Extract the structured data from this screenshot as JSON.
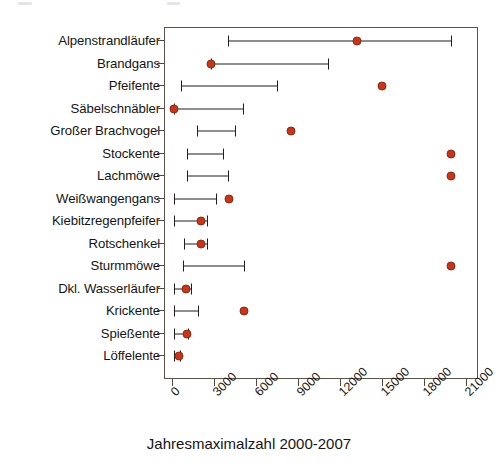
{
  "chart_data": {
    "type": "scatter",
    "title": "",
    "xlabel": "Jahresmaximalzahl 2000-2007",
    "ylabel": "",
    "xlim": [
      0,
      21850
    ],
    "ylim": [
      0,
      16
    ],
    "grid": false,
    "legend": null,
    "xticks": [
      0,
      3000,
      6000,
      9000,
      12000,
      15000,
      18000,
      21000
    ],
    "xticklabels": [
      "0",
      "3000",
      "6000",
      "9000",
      "12000",
      "15000",
      "18000",
      "21000"
    ],
    "categories": [
      "Alpenstrandläufer",
      "Brandgans",
      "Pfeifente",
      "Säbelschnäbler",
      "Großer Brachvogel",
      "Stockente",
      "Lachmöwe",
      "Weißwangengans",
      "Kiebitzregenpfeifer",
      "Rotschenkel",
      "Sturmmöwe",
      "Dkl. Wasserläufer",
      "Krickente",
      "Spießente",
      "Löffelente"
    ],
    "series": [
      {
        "name": "Spannweite",
        "type": "range",
        "low": [
          3900,
          2700,
          600,
          100,
          1700,
          1000,
          1000,
          100,
          100,
          800,
          700,
          100,
          100,
          100,
          100
        ],
        "high": [
          19850,
          11100,
          7400,
          5000,
          4400,
          3600,
          3900,
          3100,
          2400,
          2400,
          5100,
          1300,
          1800,
          1100,
          500
        ]
      },
      {
        "name": "Jahresmaximalzahl",
        "type": "point",
        "values": [
          13150,
          2700,
          14900,
          100,
          8450,
          19850,
          19850,
          4000,
          2000,
          2000,
          19850,
          900,
          5100,
          1000,
          400
        ]
      }
    ],
    "point_color": "#cc3318",
    "range_color": "#231f1c",
    "axis_color": "#5a5348"
  }
}
